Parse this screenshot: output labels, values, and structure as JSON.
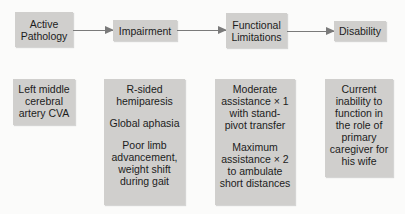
{
  "stages": [
    {
      "id": "active-pathology",
      "title_lines": [
        "Active",
        "Pathology"
      ],
      "details": [
        [
          "Left middle",
          "cerebral",
          "artery CVA"
        ]
      ]
    },
    {
      "id": "impairment",
      "title_lines": [
        "Impairment"
      ],
      "details": [
        [
          "R-sided",
          "hemiparesis"
        ],
        [
          "Global aphasia"
        ],
        [
          "Poor limb",
          "advancement,",
          "weight shift",
          "during gait"
        ]
      ]
    },
    {
      "id": "functional-limitations",
      "title_lines": [
        "Functional",
        "Limitations"
      ],
      "details": [
        [
          "Moderate",
          "assistance × 1",
          "with stand-",
          "pivot transfer"
        ],
        [
          "Maximum",
          "assistance × 2",
          "to ambulate",
          "short distances"
        ]
      ]
    },
    {
      "id": "disability",
      "title_lines": [
        "Disability"
      ],
      "details": [
        [
          "Current",
          "inability to",
          "function in",
          "the role of",
          "primary",
          "caregiver for",
          "his wife"
        ]
      ]
    }
  ],
  "colors": {
    "box_fill": "#d0cfcd",
    "arrow": "#7a7a7a",
    "background": "#fbfbfa"
  }
}
